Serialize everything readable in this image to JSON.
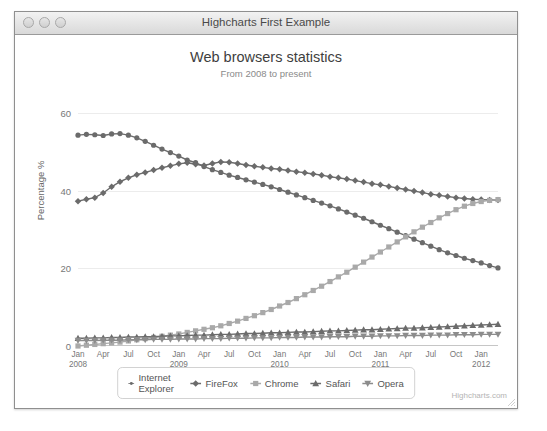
{
  "clipped_top_text": "",
  "window": {
    "title": "Highcharts First Example",
    "traffic_lights": [
      "close-button",
      "minimize-button",
      "zoom-button"
    ]
  },
  "credits": "Highcharts.com",
  "chart_data": {
    "type": "line",
    "title": "Web browsers statistics",
    "subtitle": "From 2008 to present",
    "xlabel": "",
    "ylabel": "Percentage %",
    "ylim": [
      0,
      60
    ],
    "yticks": [
      0,
      20,
      40,
      60
    ],
    "grid": true,
    "legend_position": "bottom",
    "x_tick_labels": [
      "Jan",
      "Apr",
      "Jul",
      "Oct",
      "Jan",
      "Apr",
      "Jul",
      "Oct",
      "Jan",
      "Apr",
      "Jul",
      "Oct",
      "Jan",
      "Apr",
      "Jul",
      "Oct",
      "Jan"
    ],
    "x_year_labels": [
      {
        "label": "2008",
        "index": 0
      },
      {
        "label": "2009",
        "index": 4
      },
      {
        "label": "2010",
        "index": 8
      },
      {
        "label": "2011",
        "index": 12
      },
      {
        "label": "2012",
        "index": 16
      }
    ],
    "x_count": 51,
    "series": [
      {
        "name": "Internet Explorer",
        "color": "#6b6b6b",
        "marker": "circle",
        "values": [
          54.3,
          54.5,
          54.4,
          54.2,
          54.6,
          54.7,
          54.3,
          53.6,
          52.7,
          51.7,
          50.7,
          49.8,
          48.9,
          47.9,
          47.2,
          46.2,
          45.4,
          44.7,
          44.0,
          43.4,
          42.8,
          42.2,
          41.6,
          41.0,
          40.3,
          39.6,
          38.9,
          38.2,
          37.5,
          36.8,
          36.1,
          35.3,
          34.5,
          33.7,
          32.9,
          32.0,
          31.1,
          30.2,
          29.3,
          28.4,
          27.5,
          26.6,
          25.7,
          24.8,
          24.0,
          23.3,
          22.6,
          22.0,
          21.4,
          20.7,
          20.1
        ]
      },
      {
        "name": "FireFox",
        "color": "#6b6b6b",
        "marker": "diamond",
        "values": [
          37.3,
          37.8,
          38.2,
          39.4,
          41.0,
          42.3,
          43.3,
          44.1,
          44.7,
          45.3,
          45.9,
          46.4,
          46.9,
          47.2,
          46.8,
          46.5,
          47.0,
          47.4,
          47.3,
          47.0,
          46.6,
          46.3,
          46.0,
          45.7,
          45.5,
          45.2,
          44.9,
          44.6,
          44.3,
          44.0,
          43.6,
          43.3,
          43.0,
          42.6,
          42.2,
          41.8,
          41.5,
          41.1,
          40.7,
          40.3,
          39.9,
          39.5,
          39.1,
          38.8,
          38.5,
          38.2,
          38.0,
          37.8,
          37.7,
          37.6,
          37.6
        ]
      },
      {
        "name": "Chrome",
        "color": "#a9a9a9",
        "marker": "square",
        "values": [
          0.0,
          0.2,
          0.4,
          0.6,
          0.8,
          1.0,
          1.3,
          1.6,
          1.9,
          2.2,
          2.5,
          2.8,
          3.1,
          3.5,
          3.9,
          4.3,
          4.7,
          5.2,
          5.8,
          6.4,
          7.1,
          7.8,
          8.6,
          9.4,
          10.3,
          11.2,
          12.2,
          13.2,
          14.3,
          15.4,
          16.6,
          17.8,
          19.0,
          20.3,
          21.6,
          22.9,
          24.2,
          25.5,
          26.8,
          28.1,
          29.4,
          30.6,
          31.8,
          33.0,
          34.1,
          35.1,
          36.0,
          36.7,
          37.2,
          37.5,
          37.7
        ]
      },
      {
        "name": "Safari",
        "color": "#6b6b6b",
        "marker": "triangle-up",
        "values": [
          2.0,
          2.0,
          2.1,
          2.1,
          2.2,
          2.2,
          2.3,
          2.3,
          2.4,
          2.4,
          2.5,
          2.6,
          2.6,
          2.7,
          2.8,
          2.8,
          2.9,
          3.0,
          3.0,
          3.1,
          3.2,
          3.2,
          3.3,
          3.4,
          3.4,
          3.5,
          3.6,
          3.6,
          3.7,
          3.8,
          3.9,
          3.9,
          4.0,
          4.1,
          4.2,
          4.2,
          4.3,
          4.4,
          4.5,
          4.6,
          4.6,
          4.7,
          4.8,
          4.9,
          5.0,
          5.1,
          5.2,
          5.3,
          5.4,
          5.5,
          5.6
        ]
      },
      {
        "name": "Opera",
        "color": "#8c8c8c",
        "marker": "triangle-down",
        "values": [
          1.4,
          1.4,
          1.4,
          1.5,
          1.5,
          1.5,
          1.6,
          1.6,
          1.6,
          1.7,
          1.7,
          1.7,
          1.8,
          1.8,
          1.8,
          1.9,
          1.9,
          1.9,
          2.0,
          2.0,
          2.0,
          2.1,
          2.1,
          2.1,
          2.2,
          2.2,
          2.2,
          2.3,
          2.3,
          2.3,
          2.4,
          2.4,
          2.4,
          2.5,
          2.5,
          2.5,
          2.6,
          2.6,
          2.6,
          2.7,
          2.7,
          2.7,
          2.8,
          2.8,
          2.8,
          2.9,
          2.9,
          2.9,
          3.0,
          3.0,
          3.0
        ]
      }
    ]
  }
}
